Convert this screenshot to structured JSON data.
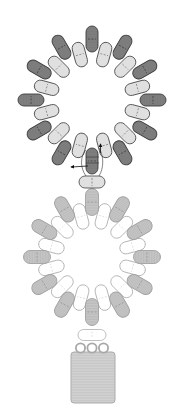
{
  "diagram": {
    "canvas": {
      "width": 182,
      "height": 409,
      "background": "#ffffff"
    },
    "rings": [
      {
        "name": "upper-ring",
        "cx": 92,
        "cy": 100,
        "outer": {
          "count": 12,
          "radius": 61,
          "start_angle": 0,
          "length": 26,
          "width": 12,
          "fill": "#808080",
          "stroke": "#3c3c3c",
          "mark": "#2e2e2e",
          "hatch": true
        },
        "inner": {
          "count": 12,
          "radius": 47,
          "start_angle": 15,
          "length": 25,
          "width": 12,
          "fill": "#e0e0e0",
          "stroke": "#555555",
          "mark": "#666666",
          "hatch": false
        }
      },
      {
        "name": "lower-ring",
        "cx": 92,
        "cy": 257,
        "outer": {
          "count": 12,
          "radius": 55,
          "start_angle": 0,
          "length": 27,
          "width": 13,
          "fill": "#c6c6c6",
          "stroke": "#a2a2a2",
          "mark": "#8a8a8a",
          "hatch": true
        },
        "inner": {
          "count": 12,
          "radius": 42,
          "start_angle": 15,
          "length": 26,
          "width": 12,
          "fill": "#ffffff",
          "stroke": "#b4b4b4",
          "mark": "#d0d0d0",
          "hatch": false
        }
      }
    ],
    "connectors": [
      {
        "name": "connector-bead-upper",
        "x": 92,
        "y": 182,
        "rot": 90,
        "length": 26,
        "width": 12,
        "fill": "#e0e0e0",
        "stroke": "#555555",
        "mark": "#555555"
      },
      {
        "name": "connector-bead-lower",
        "x": 92,
        "y": 335,
        "rot": 90,
        "length": 28,
        "width": 11,
        "fill": "#ffffff",
        "stroke": "#b8b8b8",
        "mark": "#d0d0d0"
      }
    ],
    "jump_rings": [
      {
        "x": 80.5,
        "y": 348,
        "r": 4.6
      },
      {
        "x": 92,
        "y": 348,
        "r": 4.6
      },
      {
        "x": 103.5,
        "y": 348,
        "r": 4.6
      }
    ],
    "jump_ring_style": {
      "fill": "#ffffff",
      "stroke": "#a8a8a8"
    },
    "pendant": {
      "x": 71,
      "y": 352,
      "width": 44,
      "height": 51,
      "rx": 3,
      "fill": "#d2d2d2",
      "stroke": "#ababab"
    },
    "threads": [
      "M86 150 C 80 156, 80 168, 86 176",
      "M99 148 C 104 156, 104 168, 99 176",
      "M86 157 L 99 157",
      "M86 163 L 99 163"
    ],
    "thread_color": "#333333",
    "arrows": [
      {
        "from": [
          88,
          166
        ],
        "to": [
          71,
          167
        ]
      },
      {
        "from": [
          100.5,
          153
        ],
        "to": [
          100.5,
          144
        ]
      }
    ],
    "arrow_color": "#111111"
  }
}
